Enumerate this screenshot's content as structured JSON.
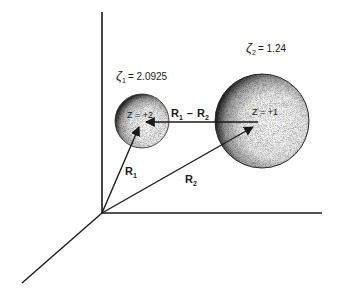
{
  "diagram": {
    "type": "3d-coordinate-sketch",
    "background": "#ffffff",
    "ink_color": "#1a1a1a",
    "spheres": [
      {
        "id": "sphere-1",
        "charge_label": "Z = +2",
        "zeta_symbol": "ζ",
        "zeta_subscript": "1",
        "zeta_value": "= 2.0925",
        "zeta_label_full": "ζ1 = 2.0925"
      },
      {
        "id": "sphere-2",
        "charge_label": "Z = +1",
        "zeta_symbol": "ζ",
        "zeta_subscript": "2",
        "zeta_value": "= 1.24",
        "zeta_label_full": "ζ2 = 1.24"
      }
    ],
    "vectors": [
      {
        "id": "R1",
        "label_main": "R",
        "label_sub": "1",
        "from": "origin",
        "to": "sphere-1 center"
      },
      {
        "id": "R2",
        "label_main": "R",
        "label_sub": "2",
        "from": "origin",
        "to": "sphere-2 center"
      },
      {
        "id": "R1-R2",
        "label_a": "R",
        "label_a_sub": "1",
        "label_op": "–",
        "label_b": "R",
        "label_b_sub": "2",
        "from": "sphere-2 center",
        "to": "sphere-1 center"
      }
    ],
    "axes": [
      "vertical",
      "horizontal",
      "diagonal (depth)"
    ]
  }
}
